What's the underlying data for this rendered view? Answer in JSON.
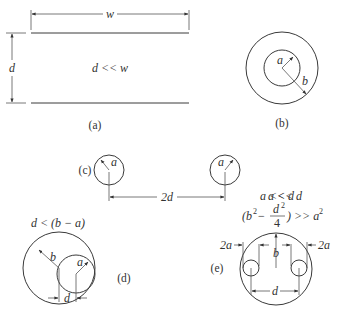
{
  "figure": {
    "panels": [
      {
        "id": "a",
        "caption": "(a)",
        "title": "Parallel plates",
        "labels": {
          "width": "w",
          "separation": "d",
          "condition": "d << w"
        }
      },
      {
        "id": "b",
        "caption": "(b)",
        "title": "Coaxial cylinders",
        "labels": {
          "inner_radius": "a",
          "outer_radius": "b"
        }
      },
      {
        "id": "c",
        "caption": "(c)",
        "title": "Two parallel wires",
        "labels": {
          "radius_left": "a",
          "radius_right": "a",
          "spacing": "2d",
          "condition": "a << d"
        }
      },
      {
        "id": "d",
        "caption": "(d)",
        "title": "Eccentric cylinders",
        "labels": {
          "outer_radius": "b",
          "inner_radius": "a",
          "offset": "d",
          "condition": "d < (b − a)"
        }
      },
      {
        "id": "e",
        "caption": "(e)",
        "title": "Two wires inside shield",
        "labels": {
          "wire_diameter_left": "2a",
          "wire_diameter_right": "2a",
          "shield_radius": "b",
          "spacing": "d",
          "condition_1": "a << d",
          "condition_2_prefix": "(b",
          "condition_2_sup": "2",
          "condition_2_minus": " − ",
          "condition_2_num": "d",
          "condition_2_num_sup": "2",
          "condition_2_den": "4",
          "condition_2_suffix": ") >> a",
          "condition_2_suffix_sup": "2"
        }
      }
    ]
  }
}
